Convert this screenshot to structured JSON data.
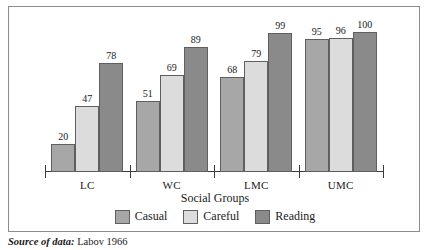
{
  "chart_data": {
    "type": "bar",
    "title": "",
    "xlabel": "Social Groups",
    "ylabel": "",
    "ylim": [
      0,
      100
    ],
    "grid": false,
    "legend_position": "bottom",
    "categories": [
      "LC",
      "WC",
      "LMC",
      "UMC"
    ],
    "series": [
      {
        "name": "Casual",
        "color": "#a7a7a7",
        "values": [
          20,
          51,
          68,
          95
        ]
      },
      {
        "name": "Careful",
        "color": "#dcdcdc",
        "values": [
          47,
          69,
          79,
          96
        ]
      },
      {
        "name": "Reading",
        "color": "#8a8a8a",
        "values": [
          78,
          89,
          99,
          100
        ]
      }
    ],
    "data_labels": true,
    "annotations": []
  },
  "axis": {
    "x_title": "Social Groups",
    "tick_labels": [
      "LC",
      "WC",
      "LMC",
      "UMC"
    ]
  },
  "legend": {
    "items": [
      {
        "label": "Casual"
      },
      {
        "label": "Careful"
      },
      {
        "label": "Reading"
      }
    ]
  },
  "caption": {
    "lead": "Source of data:",
    "reference": " Labov 1966"
  }
}
